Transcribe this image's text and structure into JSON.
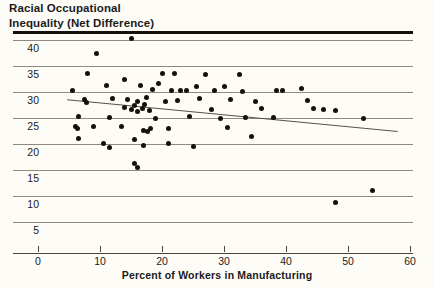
{
  "chart_data": {
    "type": "scatter",
    "title": "Racial Occupational Inequality (Net Difference)",
    "title_line1": "Racial Occupational",
    "title_line2": "Inequality (Net Difference)",
    "xlabel": "Percent of Workers in Manufacturing",
    "ylabel": "Racial Occupational Inequality (Net Difference)",
    "xlim": [
      -2,
      62
    ],
    "ylim": [
      2.5,
      42
    ],
    "xticks": [
      0,
      10,
      20,
      30,
      40,
      50,
      60
    ],
    "xtick_labels": [
      "0",
      "10",
      "20",
      "30",
      "40",
      "50",
      "60"
    ],
    "yticks": [
      5,
      10,
      15,
      20,
      25,
      30,
      35,
      40
    ],
    "ytick_labels": [
      "5",
      "10",
      "15",
      "20",
      "25",
      "30",
      "35",
      "40"
    ],
    "grid": "horizontal",
    "legend": "none",
    "marker": "filled-circle",
    "marker_color": "#14110c",
    "gridline_color": "#8f8a7e",
    "background_color": "#fdfcf7",
    "n_points": 73,
    "points": [
      [
        15.0,
        40.3
      ],
      [
        9.5,
        37.5
      ],
      [
        8.0,
        33.5
      ],
      [
        14.0,
        32.4
      ],
      [
        20.0,
        33.5
      ],
      [
        22.0,
        33.6
      ],
      [
        27.0,
        33.4
      ],
      [
        32.5,
        33.3
      ],
      [
        5.5,
        30.2
      ],
      [
        11.0,
        31.2
      ],
      [
        16.5,
        31.3
      ],
      [
        19.5,
        31.6
      ],
      [
        18.5,
        30.4
      ],
      [
        21.5,
        30.3
      ],
      [
        23.0,
        30.2
      ],
      [
        24.0,
        30.3
      ],
      [
        25.5,
        31.0
      ],
      [
        28.5,
        30.3
      ],
      [
        30.0,
        31.1
      ],
      [
        33.0,
        30.1
      ],
      [
        38.5,
        30.2
      ],
      [
        39.5,
        30.3
      ],
      [
        42.5,
        30.7
      ],
      [
        7.5,
        28.6
      ],
      [
        7.8,
        28.0
      ],
      [
        12.0,
        28.7
      ],
      [
        14.5,
        28.6
      ],
      [
        16.0,
        28.2
      ],
      [
        17.5,
        29.0
      ],
      [
        20.5,
        28.2
      ],
      [
        22.5,
        28.4
      ],
      [
        26.0,
        28.7
      ],
      [
        31.0,
        28.5
      ],
      [
        35.0,
        28.2
      ],
      [
        43.5,
        28.3
      ],
      [
        14.0,
        27.0
      ],
      [
        15.0,
        26.6
      ],
      [
        15.5,
        27.4
      ],
      [
        16.0,
        26.2
      ],
      [
        16.8,
        26.9
      ],
      [
        17.2,
        27.6
      ],
      [
        18.0,
        26.4
      ],
      [
        28.0,
        26.6
      ],
      [
        36.0,
        26.8
      ],
      [
        44.5,
        26.9
      ],
      [
        46.0,
        26.6
      ],
      [
        48.0,
        26.4
      ],
      [
        6.5,
        25.2
      ],
      [
        11.5,
        25.1
      ],
      [
        19.0,
        25.0
      ],
      [
        24.5,
        25.3
      ],
      [
        29.5,
        24.9
      ],
      [
        33.5,
        25.1
      ],
      [
        38.0,
        25.1
      ],
      [
        52.5,
        25.0
      ],
      [
        6.0,
        23.3
      ],
      [
        6.3,
        23.0
      ],
      [
        9.0,
        23.4
      ],
      [
        13.5,
        23.3
      ],
      [
        17.0,
        22.6
      ],
      [
        17.6,
        22.4
      ],
      [
        18.2,
        23.0
      ],
      [
        21.0,
        22.9
      ],
      [
        30.5,
        23.2
      ],
      [
        34.5,
        21.5
      ],
      [
        6.5,
        21.0
      ],
      [
        15.5,
        20.8
      ],
      [
        21.0,
        20.1
      ],
      [
        10.5,
        20.1
      ],
      [
        11.5,
        19.4
      ],
      [
        17.0,
        19.8
      ],
      [
        25.0,
        19.5
      ],
      [
        15.5,
        16.2
      ],
      [
        16.0,
        15.4
      ],
      [
        54.0,
        11.0
      ],
      [
        48.0,
        8.8
      ]
    ],
    "trend_line": {
      "type": "linear-fit",
      "x_start": 4.7,
      "y_start": 28.5,
      "x_end": 58.0,
      "y_end": 22.4,
      "color": "#55524a"
    }
  }
}
